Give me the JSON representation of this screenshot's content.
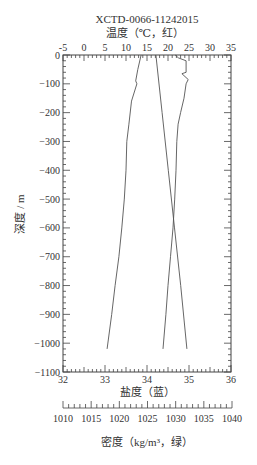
{
  "chart_data": {
    "type": "line",
    "title": "XCTD-0066-11242015",
    "top_axis": {
      "label": "温度（℃，红）",
      "ticks": [
        -5,
        0,
        5,
        10,
        15,
        20,
        25,
        30,
        35
      ],
      "range": [
        -5,
        35
      ]
    },
    "bottom_axis": {
      "label": "盐度（蓝）",
      "ticks": [
        32,
        33,
        34,
        35,
        36
      ],
      "range": [
        32,
        36
      ]
    },
    "density_axis": {
      "label": "密度（kg/m³，绿）",
      "ticks": [
        1010,
        1015,
        1020,
        1025,
        1030,
        1035,
        1040
      ],
      "range": [
        1010,
        1040
      ]
    },
    "y_axis": {
      "label": "深度 / m",
      "ticks": [
        0,
        -100,
        -200,
        -300,
        -400,
        -500,
        -600,
        -700,
        -800,
        -900,
        -1000,
        -1100
      ],
      "range": [
        -1100,
        0
      ]
    },
    "grid": false,
    "series": [
      {
        "name": "温度 (红)",
        "axis": "top",
        "color": "#555555",
        "depth": [
          0,
          -50,
          -90,
          -100,
          -160,
          -240,
          -300,
          -400,
          -500,
          -600,
          -700,
          -800,
          -900,
          -1020
        ],
        "values": [
          13.6,
          12.8,
          12.3,
          12.6,
          11.3,
          10.7,
          10.2,
          10.0,
          9.6,
          9.0,
          8.3,
          7.4,
          6.6,
          5.5
        ]
      },
      {
        "name": "盐度 (蓝)",
        "axis": "bottom",
        "color": "#555555",
        "depth": [
          0,
          -10,
          -20,
          -60,
          -65,
          -85,
          -100,
          -150,
          -200,
          -240,
          -300,
          -400,
          -500,
          -600,
          -700,
          -800,
          -900,
          -1020
        ],
        "values": [
          34.67,
          34.75,
          34.93,
          34.93,
          34.83,
          34.98,
          34.93,
          34.88,
          34.8,
          34.74,
          34.71,
          34.69,
          34.66,
          34.62,
          34.56,
          34.5,
          34.45,
          34.38
        ]
      },
      {
        "name": "密度 (绿)",
        "axis": "density",
        "color": "#555555",
        "depth": [
          0,
          -200,
          -400,
          -600,
          -800,
          -1020
        ],
        "values": [
          1026.5,
          1027.6,
          1028.7,
          1029.8,
          1030.9,
          1032.0
        ]
      }
    ]
  }
}
